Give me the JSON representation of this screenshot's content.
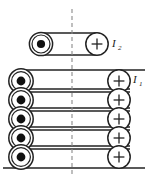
{
  "figure": {
    "type": "physics-diagram",
    "width": 148,
    "height": 179,
    "background_color": "#ffffff",
    "stroke_color": "#222222",
    "axis_color": "#888888"
  },
  "labels": {
    "upper_current": {
      "symbol": "I",
      "subscript": "2",
      "x": 112,
      "y": 46
    },
    "lower_current": {
      "symbol": "I",
      "subscript": "1",
      "x": 133,
      "y": 82
    }
  },
  "symbols": {
    "out_of_page": "dot",
    "into_page": "plus"
  },
  "upper_loop": {
    "name": "loop-I2",
    "left_symbol": "dot",
    "right_symbol": "plus",
    "left_center": {
      "x": 41,
      "y": 44
    },
    "right_center": {
      "x": 97,
      "y": 44
    },
    "radius": 11,
    "top_line_y": 33,
    "bottom_line_y": 55
  },
  "lower_stack": {
    "name": "coil-I1",
    "turn_count": 5,
    "left_center_x": 21,
    "right_center_x": 119,
    "radius": 11,
    "radius_outer": 12.5,
    "top_y": 81,
    "spacing": 19.5,
    "left_symbol": "dot",
    "right_symbol": "plus",
    "turns": [
      {
        "index": 1,
        "center_y": 81,
        "line_top_y": 70,
        "line_bottom_y": 92
      },
      {
        "index": 2,
        "center_y": 100,
        "line_top_y": 89,
        "line_bottom_y": 111
      },
      {
        "index": 3,
        "center_y": 119,
        "line_top_y": 108,
        "line_bottom_y": 130
      },
      {
        "index": 4,
        "center_y": 138,
        "line_top_y": 127,
        "line_bottom_y": 149
      },
      {
        "index": 5,
        "center_y": 157,
        "line_top_y": 146,
        "line_bottom_y": 168
      }
    ]
  },
  "axis": {
    "name": "symmetry-axis",
    "style": "dashed",
    "x": 72,
    "y_start": 9,
    "y_end": 174
  },
  "baseline": {
    "name": "baseline",
    "y": 168,
    "x_start": 3,
    "x_end": 145
  }
}
